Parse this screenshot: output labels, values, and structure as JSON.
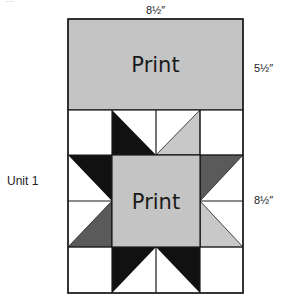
{
  "diagram": {
    "top_header_cropped": "...",
    "dimensions": {
      "top_width": "8½″",
      "print_panel_height": "5½″",
      "unit_height": "8½″"
    },
    "unit_label": "Unit 1",
    "print_panel": {
      "label": "Print",
      "fill": "#c4c4c4"
    },
    "center_square": {
      "label": "Print",
      "fill": "#c4c4c4"
    },
    "colors": {
      "black": "#111111",
      "dark_gray": "#5a5a5a",
      "light_gray": "#c8c8c8",
      "background": "#ffffff",
      "outline": "#1a1a1a"
    },
    "grid": {
      "columns": 4,
      "rows": 4,
      "description": "Sawtooth star block below print panel; 4x4 grid with center 2x2 print square"
    }
  }
}
